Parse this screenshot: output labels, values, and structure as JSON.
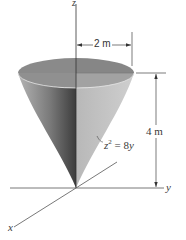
{
  "figure": {
    "axes": {
      "z_label": "z",
      "y_label": "y",
      "x_label": "x"
    },
    "dimensions": {
      "radius_label": "2 m",
      "height_label": "4 m"
    },
    "equation": {
      "lhs_var": "z",
      "exponent": "2",
      "rhs": " = 8",
      "rhs_var": "y"
    },
    "colors": {
      "top_surface": "#8c8c8c",
      "top_surface_right": "#9a9a9a",
      "left_face_light": "#a8a8a8",
      "left_face_dark": "#4a4a4a",
      "right_face": "#c4c4c4",
      "axis_line": "#444444"
    }
  }
}
